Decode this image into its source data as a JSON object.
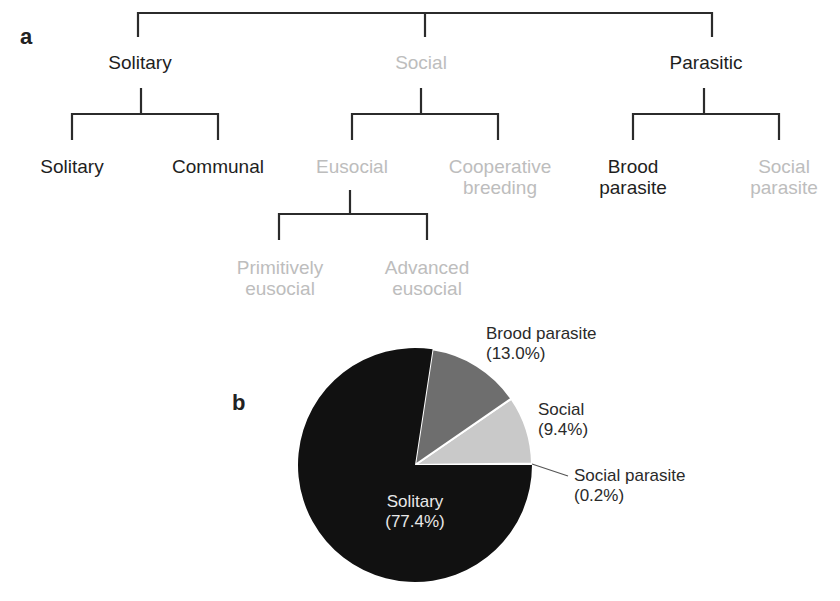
{
  "panel_a": {
    "label": "a",
    "root_children": [
      {
        "label": "Solitary",
        "style": "dark",
        "children": [
          {
            "label": "Solitary",
            "style": "dark"
          },
          {
            "label": "Communal",
            "style": "dark"
          }
        ]
      },
      {
        "label": "Social",
        "style": "light",
        "children": [
          {
            "label": "Eusocial",
            "style": "light",
            "children": [
              {
                "label_lines": [
                  "Primitively",
                  "eusocial"
                ],
                "style": "light"
              },
              {
                "label_lines": [
                  "Advanced",
                  "eusocial"
                ],
                "style": "light"
              }
            ]
          },
          {
            "label_lines": [
              "Cooperative",
              "breeding"
            ],
            "style": "light"
          }
        ]
      },
      {
        "label": "Parasitic",
        "style": "dark",
        "children": [
          {
            "label_lines": [
              "Brood",
              "parasite"
            ],
            "style": "dark"
          },
          {
            "label_lines": [
              "Social",
              "parasite"
            ],
            "style": "light"
          }
        ]
      }
    ]
  },
  "panel_b": {
    "label": "b",
    "slices": [
      {
        "name": "Solitary",
        "pct_label": "(77.4%)",
        "value": 77.4,
        "color": "#111111"
      },
      {
        "name": "Brood parasite",
        "pct_label": "(13.0%)",
        "value": 13.0,
        "color": "#6e6e6e"
      },
      {
        "name": "Social",
        "pct_label": "(9.4%)",
        "value": 9.4,
        "color": "#c9c9c9"
      },
      {
        "name": "Social parasite",
        "pct_label": "(0.2%)",
        "value": 0.2,
        "color": "#e6e6e6"
      }
    ]
  },
  "chart_data": {
    "type": "pie",
    "title": "",
    "categories": [
      "Solitary",
      "Brood parasite",
      "Social",
      "Social parasite"
    ],
    "values": [
      77.4,
      13.0,
      9.4,
      0.2
    ],
    "labels": [
      "Solitary (77.4%)",
      "Brood parasite (13.0%)",
      "Social (9.4%)",
      "Social parasite (0.2%)"
    ],
    "colors": [
      "#111111",
      "#6e6e6e",
      "#c9c9c9",
      "#e6e6e6"
    ],
    "start_angle": "3 o'clock, counter-clockwise for minor slices",
    "legend": "none (direct labels)"
  }
}
